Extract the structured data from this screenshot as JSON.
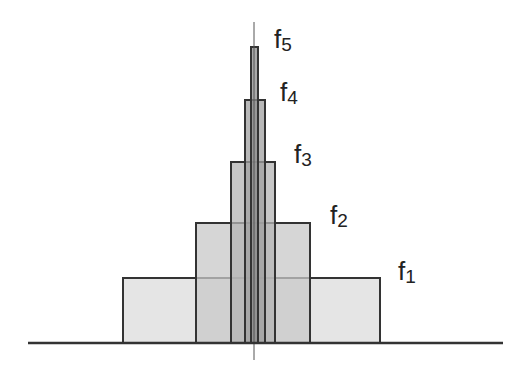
{
  "diagram": {
    "title": "",
    "center_x": 254,
    "baseline": {
      "y": 343,
      "x1": 28,
      "x2": 503
    },
    "center_line": {
      "x": 254,
      "y1": 22,
      "y2": 360
    },
    "rects": [
      {
        "id": "f1",
        "x": 123,
        "y": 278,
        "w": 257,
        "h": 65,
        "fill": "#dcdcdc"
      },
      {
        "id": "f2",
        "x": 196,
        "y": 223,
        "w": 114,
        "h": 120,
        "fill": "#c8c8c8"
      },
      {
        "id": "f3",
        "x": 231,
        "y": 162,
        "w": 44,
        "h": 181,
        "fill": "#b4b4b4"
      },
      {
        "id": "f4",
        "x": 245,
        "y": 100,
        "w": 20,
        "h": 243,
        "fill": "#a0a0a0"
      },
      {
        "id": "f5",
        "x": 251,
        "y": 47,
        "w": 7,
        "h": 296,
        "fill": "#8c8c8c"
      }
    ],
    "labels": [
      {
        "base": "f",
        "sub": "1",
        "x": 398,
        "y": 258
      },
      {
        "base": "f",
        "sub": "2",
        "x": 330,
        "y": 202
      },
      {
        "base": "f",
        "sub": "3",
        "x": 294,
        "y": 141
      },
      {
        "base": "f",
        "sub": "4",
        "x": 280,
        "y": 79
      },
      {
        "base": "f",
        "sub": "5",
        "x": 274,
        "y": 26
      }
    ],
    "stroke_color": "#333333"
  }
}
